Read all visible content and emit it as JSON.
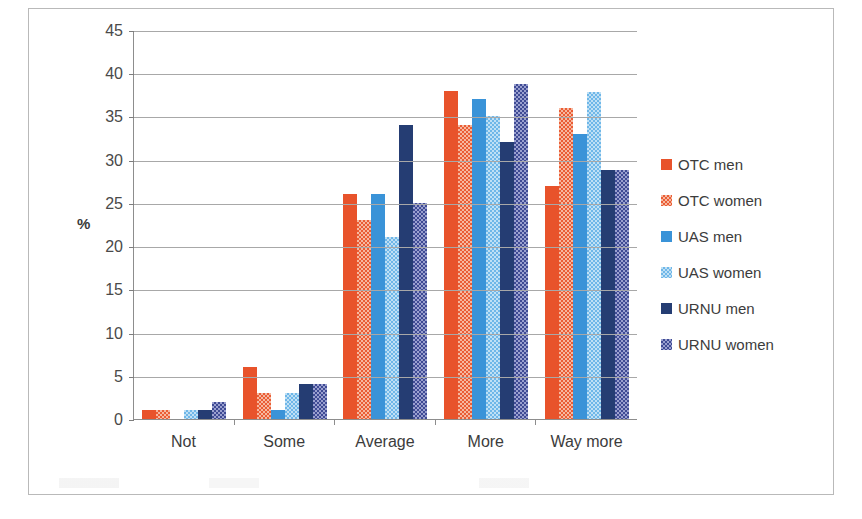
{
  "chart_data": {
    "type": "bar",
    "title": "",
    "subtitle": "",
    "xlabel": "",
    "ylabel": "%",
    "categories": [
      "Not",
      "Some",
      "Average",
      "More",
      "Way more"
    ],
    "ylim": [
      0,
      45
    ],
    "ytick_step": 5,
    "yticks": [
      "45",
      "40",
      "35",
      "30",
      "25",
      "20",
      "15",
      "10",
      "5",
      "0"
    ],
    "grid": true,
    "legend_position": "right",
    "series": [
      {
        "name": "OTC men",
        "color": "#e8532b",
        "pattern": "solid",
        "values": [
          1,
          6,
          26,
          38,
          27
        ]
      },
      {
        "name": "OTC women",
        "color": "#ea5d35",
        "pattern": "checker",
        "values": [
          1,
          3,
          23,
          34,
          36
        ]
      },
      {
        "name": "UAS men",
        "color": "#3a93d8",
        "pattern": "solid",
        "values": [
          0,
          1,
          26,
          37,
          33
        ]
      },
      {
        "name": "UAS women",
        "color": "#6fb7e8",
        "pattern": "checker",
        "values": [
          1,
          3,
          21,
          35,
          37.8
        ]
      },
      {
        "name": "URNU men",
        "color": "#253d73",
        "pattern": "solid",
        "values": [
          1,
          4,
          34,
          32,
          28.8
        ]
      },
      {
        "name": "URNU women",
        "color": "#3f4b94",
        "pattern": "checker",
        "values": [
          2,
          4,
          25,
          38.8,
          28.8
        ]
      }
    ]
  }
}
